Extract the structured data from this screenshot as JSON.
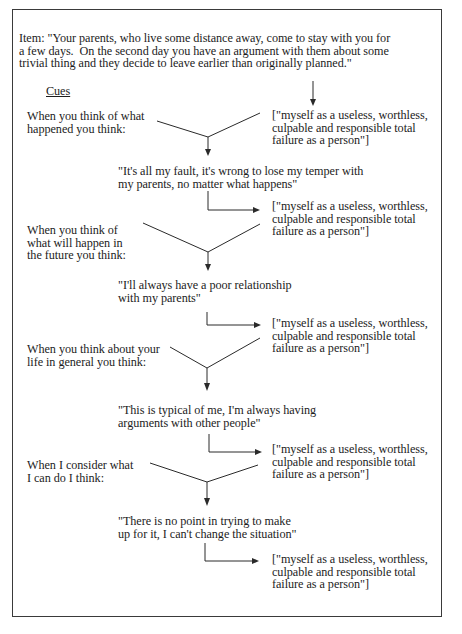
{
  "item": {
    "text": "Item: \"Your parents, who live some distance away, come to stay with you for\na few days.  On the second day you have an argument with them about some\ntrivial thing and they decide to leave earlier than originally planned.\""
  },
  "cues_label": "Cues",
  "outcome_text": "[\"myself as a useless, worthless,\nculpable and responsible total\nfailure as a person\"]",
  "steps": [
    {
      "cue": "When you think of what\nhappened you think:",
      "thought": "\"It's all my fault, it's wrong to lose my temper with\nmy parents, no matter what happens\"",
      "outcome": "[\"myself as a useless, worthless,\nculpable and responsible total\nfailure as a person\"]"
    },
    {
      "cue": "When you think of\nwhat will happen in\nthe future you think:",
      "thought": "\"I'll always have a poor relationship\nwith my parents\"",
      "outcome": "[\"myself as a useless, worthless,\nculpable and responsible total\nfailure as a person\"]"
    },
    {
      "cue": "When you think about your\nlife in general you think:",
      "thought": "\"This is typical of me, I'm always having\narguments with other people\"",
      "outcome": "[\"myself as a useless, worthless,\nculpable and responsible total\nfailure as a person\"]"
    },
    {
      "cue": "When I consider what\nI can do I think:",
      "thought": "\"There is no point in trying to make\nup for it, I can't change the situation\"",
      "outcome": "[\"myself as a useless, worthless,\nculpable and responsible total\nfailure as a person\"]"
    }
  ],
  "final_outcome": "[\"myself as a useless, worthless,\nculpable and responsible total\nfailure as a person\"]",
  "colors": {
    "text": "#1c1c1c",
    "lines": "#2a2a2a",
    "border": "#3a3a3a",
    "background": "#ffffff"
  }
}
